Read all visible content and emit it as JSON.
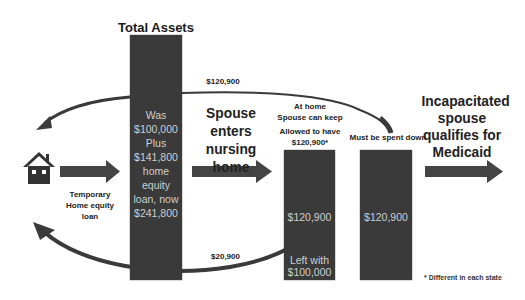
{
  "diagram": {
    "title": "Total Assets",
    "total_assets_bar": {
      "lines": [
        "Was",
        "$100,000",
        "Plus",
        "$141,800",
        "home",
        "equity",
        "loan, now",
        "$241,800"
      ]
    },
    "upper_arc_label": "$120,900",
    "lower_arc_label": "$20,900",
    "house_icon": "house-icon",
    "loan_label": [
      "Temporary",
      "Home equity",
      "loan"
    ],
    "step2_label": [
      "Spouse",
      "enters",
      "nursing home"
    ],
    "at_home": {
      "line1": "At home",
      "line2": "Spouse can keep",
      "line3": "Allowed to have",
      "line4": "$120,900*"
    },
    "keep_bar": {
      "amount": "$120,900",
      "left_with_1": "Left with",
      "left_with_2": "$100,000"
    },
    "spend_down_label": "Must be spent down",
    "spend_bar": {
      "amount": "$120,900"
    },
    "result_label": [
      "Incapacitated",
      "spouse",
      "qualifies for",
      "Medicaid"
    ],
    "footnote": "* Different in each state",
    "colors": {
      "bar": "#3a3a3a",
      "arrow": "#444444",
      "bar_text": "#cfcfcf"
    }
  }
}
